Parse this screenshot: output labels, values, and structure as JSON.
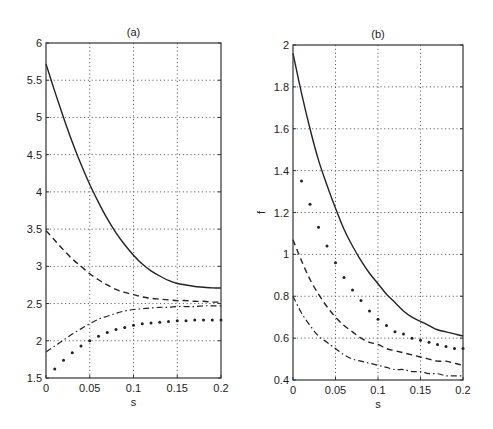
{
  "chart_data": [
    {
      "id": "a",
      "type": "line",
      "title": "(a)",
      "xlabel": "s",
      "ylabel": "",
      "xlim": [
        0,
        0.2
      ],
      "ylim": [
        1.5,
        6
      ],
      "xticks": [
        0,
        0.05,
        0.1,
        0.15,
        0.2
      ],
      "xtick_labels": [
        "0",
        "0.05",
        "0.1",
        "0.15",
        "0.2"
      ],
      "yticks": [
        1.5,
        2,
        2.5,
        3,
        3.5,
        4,
        4.5,
        5,
        5.5,
        6
      ],
      "ytick_labels": [
        "1.5",
        "2",
        "2.5",
        "3",
        "3.5",
        "4",
        "4.5",
        "5",
        "5.5",
        "6"
      ],
      "grid": true,
      "legend": null,
      "x": [
        0,
        0.01,
        0.02,
        0.03,
        0.04,
        0.05,
        0.06,
        0.07,
        0.08,
        0.09,
        0.1,
        0.11,
        0.12,
        0.13,
        0.14,
        0.15,
        0.16,
        0.17,
        0.18,
        0.19,
        0.2
      ],
      "series": [
        {
          "name": "solid",
          "style": "solid",
          "values": [
            5.72,
            5.35,
            5.0,
            4.67,
            4.37,
            4.1,
            3.86,
            3.64,
            3.45,
            3.29,
            3.15,
            3.03,
            2.94,
            2.87,
            2.81,
            2.77,
            2.75,
            2.73,
            2.72,
            2.71,
            2.71
          ]
        },
        {
          "name": "dashed",
          "style": "dashed",
          "values": [
            3.48,
            3.35,
            3.22,
            3.1,
            3.0,
            2.9,
            2.82,
            2.75,
            2.69,
            2.65,
            2.62,
            2.59,
            2.57,
            2.56,
            2.55,
            2.54,
            2.54,
            2.53,
            2.53,
            2.52,
            2.52
          ]
        },
        {
          "name": "dash-dot",
          "style": "dashdot",
          "values": [
            1.85,
            1.93,
            2.01,
            2.09,
            2.16,
            2.23,
            2.29,
            2.33,
            2.37,
            2.4,
            2.42,
            2.43,
            2.44,
            2.45,
            2.45,
            2.46,
            2.46,
            2.46,
            2.47,
            2.47,
            2.47
          ]
        },
        {
          "name": "dotted",
          "style": "dots",
          "values": [
            null,
            1.62,
            1.74,
            1.84,
            1.93,
            2.0,
            2.06,
            2.11,
            2.15,
            2.18,
            2.21,
            2.23,
            2.24,
            2.25,
            2.26,
            2.27,
            2.27,
            2.28,
            2.28,
            2.28,
            2.28
          ]
        }
      ]
    },
    {
      "id": "b",
      "type": "line",
      "title": "(b)",
      "xlabel": "s",
      "ylabel": "f",
      "xlim": [
        0,
        0.2
      ],
      "ylim": [
        0.4,
        2
      ],
      "xticks": [
        0,
        0.05,
        0.1,
        0.15,
        0.2
      ],
      "xtick_labels": [
        "0",
        "0.05",
        "0.1",
        "0.15",
        "0.2"
      ],
      "yticks": [
        0.4,
        0.6,
        0.8,
        1,
        1.2,
        1.4,
        1.6,
        1.8,
        2
      ],
      "ytick_labels": [
        "0.4",
        "0.6",
        "0.8",
        "1",
        "1.2",
        "1.4",
        "1.6",
        "1.8",
        "2"
      ],
      "grid": true,
      "legend": null,
      "x": [
        0,
        0.01,
        0.02,
        0.03,
        0.04,
        0.05,
        0.06,
        0.07,
        0.08,
        0.09,
        0.1,
        0.11,
        0.12,
        0.13,
        0.14,
        0.15,
        0.16,
        0.17,
        0.18,
        0.19,
        0.2
      ],
      "series": [
        {
          "name": "solid",
          "style": "solid",
          "values": [
            1.96,
            1.77,
            1.6,
            1.45,
            1.33,
            1.22,
            1.12,
            1.04,
            0.97,
            0.91,
            0.86,
            0.81,
            0.77,
            0.73,
            0.7,
            0.68,
            0.66,
            0.64,
            0.63,
            0.62,
            0.61
          ]
        },
        {
          "name": "dotted",
          "style": "dots",
          "values": [
            null,
            1.35,
            1.24,
            1.13,
            1.04,
            0.96,
            0.89,
            0.83,
            0.78,
            0.73,
            0.69,
            0.66,
            0.63,
            0.62,
            0.6,
            0.59,
            0.58,
            0.57,
            0.56,
            0.55,
            0.55
          ]
        },
        {
          "name": "dashed",
          "style": "dashed",
          "values": [
            1.07,
            0.97,
            0.88,
            0.81,
            0.75,
            0.7,
            0.66,
            0.63,
            0.6,
            0.58,
            0.57,
            0.55,
            0.54,
            0.53,
            0.52,
            0.51,
            0.5,
            0.49,
            0.49,
            0.48,
            0.47
          ]
        },
        {
          "name": "dash-dot",
          "style": "dashdot",
          "values": [
            0.8,
            0.72,
            0.66,
            0.61,
            0.58,
            0.55,
            0.52,
            0.5,
            0.49,
            0.48,
            0.47,
            0.46,
            0.45,
            0.45,
            0.44,
            0.44,
            0.43,
            0.43,
            0.42,
            0.42,
            0.42
          ]
        }
      ]
    }
  ],
  "layout": {
    "a": {
      "left": 46,
      "top": 43,
      "right": 221,
      "bottom": 378
    },
    "b": {
      "left": 293,
      "top": 45,
      "right": 463,
      "bottom": 380
    }
  }
}
